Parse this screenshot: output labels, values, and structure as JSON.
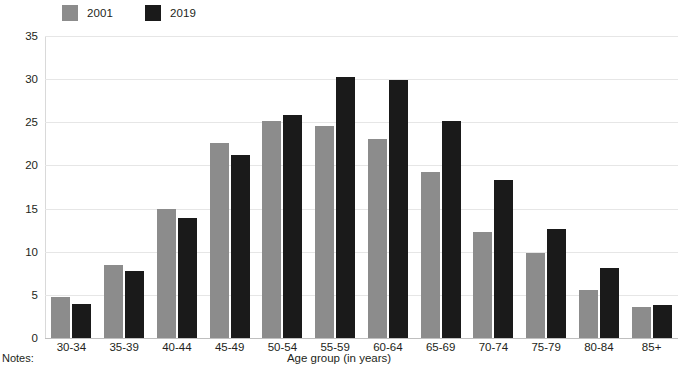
{
  "chart_data": {
    "type": "bar",
    "title": "",
    "xlabel": "Age group (in years)",
    "ylabel": "",
    "ylim": [
      0,
      35
    ],
    "yticks": [
      0,
      5,
      10,
      15,
      20,
      25,
      30,
      35
    ],
    "grid": true,
    "legend_position": "top-left",
    "categories": [
      "30-34",
      "35-39",
      "40-44",
      "45-49",
      "50-54",
      "55-59",
      "60-64",
      "65-69",
      "70-74",
      "75-79",
      "80-84",
      "85+"
    ],
    "series": [
      {
        "name": "2001",
        "color": "#8c8c8c",
        "values": [
          4.8,
          8.5,
          15.0,
          22.6,
          25.2,
          24.6,
          23.1,
          19.2,
          12.3,
          9.9,
          5.6,
          3.6
        ]
      },
      {
        "name": "2019",
        "color": "#1a1a1a",
        "values": [
          4.0,
          7.8,
          13.9,
          21.2,
          25.8,
          30.3,
          29.9,
          25.1,
          18.3,
          12.6,
          8.1,
          3.8
        ]
      }
    ]
  },
  "footer": {
    "notes_label": "Notes:"
  }
}
